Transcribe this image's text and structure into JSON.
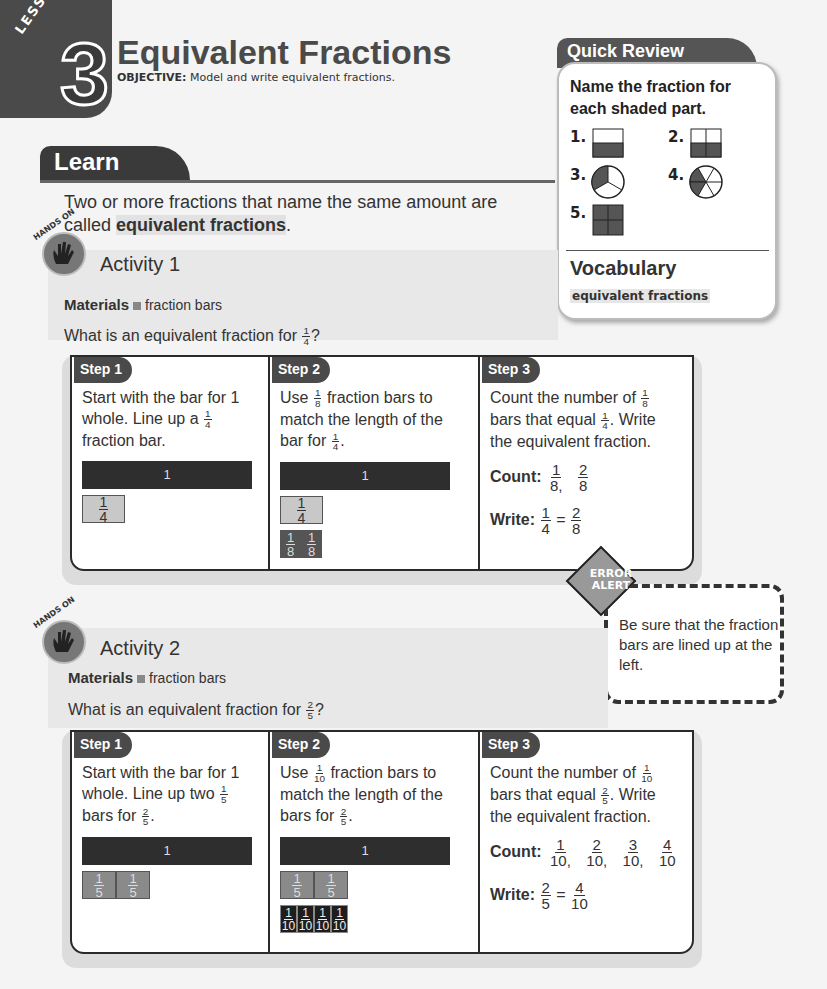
{
  "lesson": {
    "word": "LESSON",
    "number": "3",
    "title": "Equivalent Fractions",
    "objective_label": "OBJECTIVE:",
    "objective_text": "Model and write equivalent fractions."
  },
  "learn": {
    "tab_label": "Learn",
    "intro_before": "Two or more fractions that name the same amount are called ",
    "intro_term": "equivalent fractions",
    "intro_after": "."
  },
  "quick_review": {
    "tab_label": "Quick Review",
    "prompt": "Name the fraction for each shaded part.",
    "items": [
      {
        "number": "1.",
        "shape": "rectangle-halves-bottom-shaded"
      },
      {
        "number": "2.",
        "shape": "square-quarters-bottom-two-shaded"
      },
      {
        "number": "3.",
        "shape": "circle-thirds-one-shaded"
      },
      {
        "number": "4.",
        "shape": "circle-sixths-two-shaded"
      },
      {
        "number": "5.",
        "shape": "square-quarters-all-shaded"
      }
    ],
    "vocab_heading": "Vocabulary",
    "vocab_term": "equivalent fractions"
  },
  "activity1": {
    "badge": "HANDS ON",
    "title": "Activity 1",
    "materials_label": "Materials",
    "materials_item": "fraction bars",
    "question_before": "What is an equivalent fraction for ",
    "question_frac": {
      "n": "1",
      "d": "4"
    },
    "question_after": "?",
    "steps": [
      {
        "label": "Step 1",
        "text_1": "Start with the bar for 1 whole. Line up a",
        "frac": {
          "n": "1",
          "d": "4"
        },
        "text_2": "fraction bar.",
        "whole_label": "1",
        "pieces": [
          {
            "n": "1",
            "d": "4"
          }
        ]
      },
      {
        "label": "Step 2",
        "text_1": "Use",
        "frac": {
          "n": "1",
          "d": "8"
        },
        "text_2": "fraction bars to match the length of the bar for",
        "frac2": {
          "n": "1",
          "d": "4"
        },
        "text_3": ".",
        "whole_label": "1",
        "pieces": [
          {
            "n": "1",
            "d": "4"
          }
        ],
        "small_pieces": [
          {
            "n": "1",
            "d": "8"
          },
          {
            "n": "1",
            "d": "8"
          }
        ]
      },
      {
        "label": "Step 3",
        "text_1": "Count the number of",
        "frac": {
          "n": "1",
          "d": "8"
        },
        "text_2": "bars that equal",
        "frac2": {
          "n": "1",
          "d": "4"
        },
        "text_3": ". Write the equivalent fraction.",
        "count_label": "Count:",
        "count": [
          {
            "n": "1",
            "d": "8,"
          },
          {
            "n": "2",
            "d": "8"
          }
        ],
        "write_label": "Write:",
        "write_left": {
          "n": "1",
          "d": "4"
        },
        "write_eq": "=",
        "write_right": {
          "n": "2",
          "d": "8"
        }
      }
    ]
  },
  "error_alert": {
    "badge_line1": "ERROR",
    "badge_line2": "ALERT",
    "message": "Be sure that the fraction bars are lined up at the left."
  },
  "activity2": {
    "badge": "HANDS ON",
    "title": "Activity 2",
    "materials_label": "Materials",
    "materials_item": "fraction bars",
    "question_before": "What is an equivalent fraction for ",
    "question_frac": {
      "n": "2",
      "d": "5"
    },
    "question_after": "?",
    "steps": [
      {
        "label": "Step 1",
        "text_1": "Start with the bar for 1 whole. Line up two",
        "frac": {
          "n": "1",
          "d": "5"
        },
        "text_2": "bars for",
        "frac2": {
          "n": "2",
          "d": "5"
        },
        "text_3": ".",
        "whole_label": "1",
        "pieces": [
          {
            "n": "1",
            "d": "5"
          },
          {
            "n": "1",
            "d": "5"
          }
        ]
      },
      {
        "label": "Step 2",
        "text_1": "Use",
        "frac": {
          "n": "1",
          "d": "10"
        },
        "text_2": "fraction bars to match the length of the bars for",
        "frac2": {
          "n": "2",
          "d": "5"
        },
        "text_3": ".",
        "whole_label": "1",
        "pieces": [
          {
            "n": "1",
            "d": "5"
          },
          {
            "n": "1",
            "d": "5"
          }
        ],
        "small_pieces": [
          {
            "n": "1",
            "d": "10"
          },
          {
            "n": "1",
            "d": "10"
          },
          {
            "n": "1",
            "d": "10"
          },
          {
            "n": "1",
            "d": "10"
          }
        ]
      },
      {
        "label": "Step 3",
        "text_1": "Count the number of",
        "frac": {
          "n": "1",
          "d": "10"
        },
        "text_2": "bars that equal",
        "frac2": {
          "n": "2",
          "d": "5"
        },
        "text_3": ". Write the equivalent fraction.",
        "count_label": "Count:",
        "count": [
          {
            "n": "1",
            "d": "10,"
          },
          {
            "n": "2",
            "d": "10,"
          },
          {
            "n": "3",
            "d": "10,"
          },
          {
            "n": "4",
            "d": "10"
          }
        ],
        "write_label": "Write:",
        "write_left": {
          "n": "2",
          "d": "5"
        },
        "write_eq": "=",
        "write_right": {
          "n": "4",
          "d": "10"
        }
      }
    ]
  }
}
